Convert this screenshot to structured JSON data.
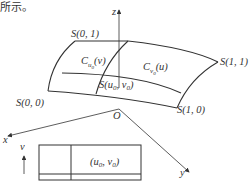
{
  "header_text": "所示。",
  "axes": {
    "z": "z",
    "x": "x",
    "y": "y",
    "origin": "O",
    "v_axis": "v"
  },
  "corners": {
    "s00": "S(0, 0)",
    "s01": "S(0, 1)",
    "s11": "S(1, 1)",
    "s10": "S(1, 0)"
  },
  "curves": {
    "cu0_base": "C",
    "cu0_sub": "u",
    "cu0_subsub": "0",
    "cu0_arg": "(v)",
    "cv0_base": "C",
    "cv0_sub": "v",
    "cv0_subsub": "0",
    "cv0_arg": "(u)"
  },
  "point": {
    "label": "S(u",
    "sub1": "0",
    "mid": ", v",
    "sub2": "0",
    "end": ")"
  },
  "domain": {
    "label": "(u",
    "sub1": "0",
    "mid": ", v",
    "sub2": "0",
    "end": ")"
  },
  "colors": {
    "ink": "#333333",
    "background": "#ffffff"
  }
}
